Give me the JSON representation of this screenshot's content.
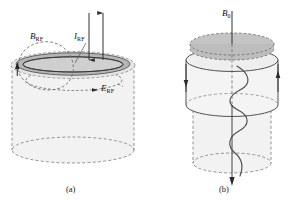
{
  "figure": {
    "title": "",
    "panels": [
      {
        "id": "a",
        "caption": "(a)",
        "labels": {
          "b_rf": "B",
          "b_rf_sub": "RF",
          "i_rf": "I",
          "i_rf_sub": "RF",
          "e_rf": "E",
          "e_rf_sub": "RF"
        }
      },
      {
        "id": "b",
        "caption": "(b)",
        "labels": {
          "b0": "B",
          "b0_sub": "0"
        }
      }
    ]
  },
  "colors": {
    "stroke": "#3a3a3a",
    "dashed_stroke": "#6b6b6b",
    "ring_fill": "#b4b4b4",
    "body_fill": "#f1f1f1",
    "cap_fill": "#c9c9c9",
    "text": "#111111",
    "background": "#ffffff"
  },
  "elements": {
    "panel_a": {
      "shape": "cylinder-with-annular-top-ring",
      "arrows": [
        {
          "name": "current-arrow-down",
          "direction": "down"
        },
        {
          "name": "current-arrow-up",
          "direction": "up"
        },
        {
          "name": "b-field-loop-arrow",
          "direction": "up"
        },
        {
          "name": "e-field-loop-arrow",
          "direction": "right"
        }
      ],
      "loops": [
        {
          "name": "b-rf-field-loop",
          "style": "dashed"
        },
        {
          "name": "e-rf-field-loop",
          "style": "dashed"
        }
      ]
    },
    "panel_b": {
      "shape": "double-cylinder",
      "arrows": [
        {
          "name": "b0-axis-arrow",
          "direction": "down"
        },
        {
          "name": "side-current-arrow-left",
          "direction": "down"
        },
        {
          "name": "side-current-arrow-right",
          "direction": "up"
        }
      ],
      "paths": [
        {
          "name": "helical-trajectory",
          "style": "solid-wave"
        }
      ]
    }
  }
}
